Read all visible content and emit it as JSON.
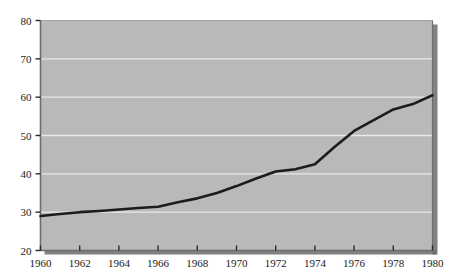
{
  "chart_data": {
    "type": "line",
    "title": "",
    "subtitle": "",
    "xlabel": "",
    "ylabel": "",
    "xlim": [
      1960,
      1980
    ],
    "ylim": [
      20,
      80
    ],
    "grid": true,
    "grid_axis": "y",
    "legend": false,
    "legend_position": "none",
    "x_tick_labels": [
      "1960",
      "1962",
      "1964",
      "1966",
      "1968",
      "1970",
      "1972",
      "1974",
      "1976",
      "1978",
      "1980"
    ],
    "x_ticks": [
      1960,
      1962,
      1964,
      1966,
      1968,
      1970,
      1972,
      1974,
      1976,
      1978,
      1980
    ],
    "y_tick_labels": [
      "20",
      "30",
      "40",
      "50",
      "60",
      "70",
      "80"
    ],
    "y_ticks": [
      20,
      30,
      40,
      50,
      60,
      70,
      80
    ],
    "x": [
      1960,
      1961,
      1962,
      1963,
      1964,
      1965,
      1966,
      1967,
      1968,
      1969,
      1970,
      1971,
      1972,
      1973,
      1974,
      1975,
      1976,
      1977,
      1978,
      1979,
      1980
    ],
    "series": [
      {
        "name": "series-1",
        "values": [
          29.0,
          29.5,
          30.0,
          30.3,
          30.7,
          31.1,
          31.4,
          32.6,
          33.6,
          35.0,
          36.8,
          38.8,
          40.6,
          41.2,
          42.5,
          47.0,
          51.2,
          54.0,
          56.8,
          58.2,
          60.5
        ]
      }
    ],
    "values_tail_note": "",
    "colors": {
      "line": "#1c1c1c",
      "plot_background": "#b9b9b9",
      "gridline": "#e8e8e8",
      "axis": "#6e6e6e",
      "shadow": "#6b6b6b",
      "page_background": "#ffffff",
      "tick_text": "#1a1a1a"
    }
  },
  "plot": {
    "line_values_full": [
      29.0,
      29.5,
      30.0,
      30.3,
      30.7,
      31.1,
      31.4,
      32.6,
      33.6,
      35.0,
      36.8,
      38.8,
      40.6,
      41.2,
      42.5,
      47.0,
      51.2,
      54.0,
      56.8,
      58.2,
      60.5
    ]
  }
}
